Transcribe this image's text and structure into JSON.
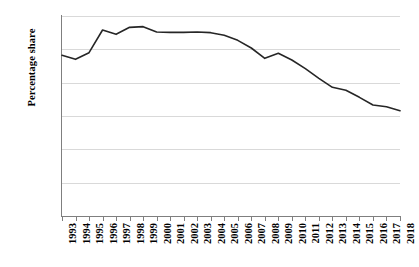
{
  "chart_data": {
    "type": "line",
    "title": "",
    "xlabel": "",
    "ylabel": "Percentage share",
    "ylim": [
      0,
      60
    ],
    "ytick_labels": [
      "0%",
      "10%",
      "20%",
      "30%",
      "40%",
      "50%",
      "60%"
    ],
    "ytick_values": [
      0,
      10,
      20,
      30,
      40,
      50,
      60
    ],
    "grid": true,
    "legend": "none",
    "line_color": "#262626",
    "categories": [
      "1993",
      "1994",
      "1995",
      "1996",
      "1997",
      "1998",
      "1999",
      "2000",
      "2001",
      "2002",
      "2003",
      "2004",
      "2005",
      "2006",
      "2007",
      "2008",
      "2009",
      "2010",
      "2011",
      "2012",
      "2013",
      "2014",
      "2015",
      "2016",
      "2017",
      "2018"
    ],
    "series": [
      {
        "name": "Percentage share",
        "values": [
          48.2,
          47.0,
          49.0,
          55.8,
          54.5,
          56.6,
          56.8,
          55.2,
          55.1,
          55.1,
          55.2,
          55.0,
          54.2,
          52.7,
          50.4,
          47.3,
          48.8,
          46.8,
          44.2,
          41.3,
          38.6,
          37.7,
          35.6,
          33.3,
          32.8,
          31.6
        ]
      }
    ]
  },
  "axis": {
    "y_title": "Percentage share"
  }
}
